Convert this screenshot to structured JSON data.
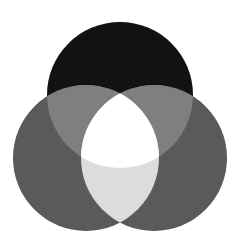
{
  "diagram": {
    "type": "venn",
    "sets": [
      {
        "id": "top",
        "cx": 120,
        "cy": 95,
        "r": 73,
        "color": "#121212"
      },
      {
        "id": "left",
        "cx": 86,
        "cy": 158,
        "r": 73,
        "color": "#5a5a5a"
      },
      {
        "id": "right",
        "cx": 154,
        "cy": 158,
        "r": 73,
        "color": "#5a5a5a"
      }
    ],
    "regions": {
      "top_only": "#121212",
      "left_only": "#5a5a5a",
      "right_only": "#5a5a5a",
      "top_left": "#7f7f7f",
      "top_right": "#7f7f7f",
      "left_right": "#dcdcdc",
      "all_three": "#ffffff"
    },
    "background": "#ffffff"
  }
}
